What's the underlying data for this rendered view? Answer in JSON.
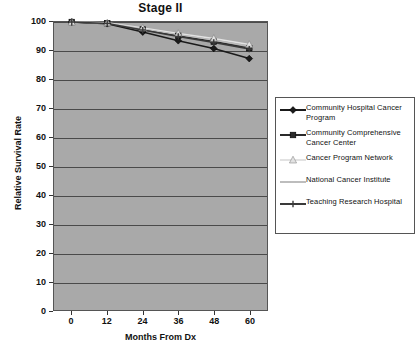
{
  "chart_data": {
    "type": "line",
    "title": "Stage II",
    "xlabel": "Months From Dx",
    "ylabel": "Relative Survival Rate",
    "x": [
      0,
      12,
      24,
      36,
      48,
      60
    ],
    "xticks": [
      "0",
      "12",
      "24",
      "36",
      "48",
      "60"
    ],
    "yticks": [
      "0",
      "10",
      "20",
      "30",
      "40",
      "50",
      "60",
      "70",
      "80",
      "90",
      "100"
    ],
    "xlim": [
      -6,
      66
    ],
    "ylim": [
      0,
      100
    ],
    "grid": true,
    "legend_position": "right",
    "series": [
      {
        "name": "Community Hospital Cancer Program",
        "marker": "diamond",
        "color": "#1a1a1a",
        "values": [
          100,
          99.4,
          96.5,
          93.5,
          90.8,
          87.3
        ]
      },
      {
        "name": "Community Comprehensive Cancer Center",
        "marker": "square",
        "color": "#2b2b2b",
        "values": [
          100,
          99.6,
          97.4,
          95.2,
          93.2,
          90.9
        ]
      },
      {
        "name": "Cancer Program Network",
        "marker": "triangle",
        "color": "#e2e2e2",
        "values": [
          100,
          99.7,
          97.9,
          96.0,
          94.3,
          92.2
        ]
      },
      {
        "name": "National Cancer Institute",
        "marker": "line",
        "color": "#bdbdbd",
        "values": [
          100,
          99.6,
          97.6,
          95.6,
          93.7,
          91.6
        ]
      },
      {
        "name": "Teaching Research Hospital",
        "marker": "cross",
        "color": "#3a3a3a",
        "values": [
          100,
          99.5,
          97.2,
          95.0,
          92.9,
          90.6
        ]
      }
    ]
  },
  "plot": {
    "background_color": "#a9a9a9",
    "gridline_color": "#4a4a4a",
    "border_color": "#555555"
  }
}
